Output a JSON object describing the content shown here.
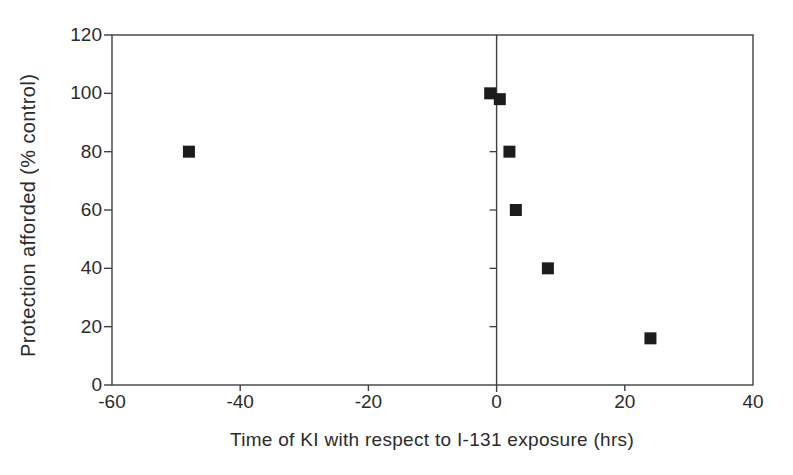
{
  "chart_data": {
    "type": "scatter",
    "title": "",
    "xlabel": "Time of KI with respect to I-131 exposure (hrs)",
    "ylabel": "Protection afforded (% control)",
    "xlim": [
      -60,
      40
    ],
    "ylim": [
      0,
      120
    ],
    "x_ticks": [
      -60,
      -40,
      -20,
      0,
      20,
      40
    ],
    "y_ticks": [
      0,
      20,
      40,
      60,
      80,
      100,
      120
    ],
    "grid": false,
    "legend": false,
    "axis_color": "#3f3f3f",
    "label_color": "#2b2b2b",
    "marker": {
      "shape": "filled-square",
      "color": "#1c1c1c",
      "size_px": 12
    },
    "zero_axis_line": {
      "x": 0,
      "minor_ticks_y": [
        20,
        40,
        60,
        80
      ]
    },
    "points": [
      {
        "x": -48,
        "y": 80
      },
      {
        "x": -1,
        "y": 100
      },
      {
        "x": 0.5,
        "y": 98
      },
      {
        "x": 2,
        "y": 80
      },
      {
        "x": 3,
        "y": 60
      },
      {
        "x": 8,
        "y": 40
      },
      {
        "x": 24,
        "y": 16
      }
    ]
  }
}
